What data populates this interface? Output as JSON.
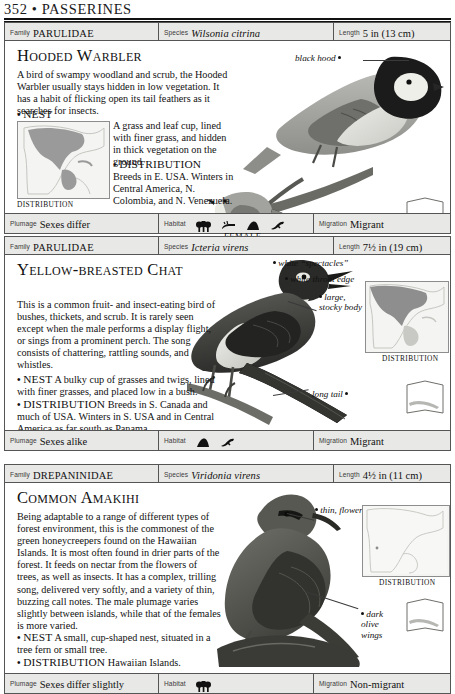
{
  "page": {
    "folio": "352 • PASSERINES"
  },
  "labels": {
    "family": "Family",
    "species": "Species",
    "length": "Length",
    "plumage": "Plumage",
    "habitat": "Habitat",
    "migration": "Migration",
    "distribution_caption": "DISTRIBUTION",
    "female_caption": "FEMALE"
  },
  "entries": [
    {
      "family": "PARULIDAE",
      "species": "Wilsonia citrina",
      "length": "5 in (13 cm)",
      "title": "Hooded Warbler",
      "description": "A bird of swampy woodland and scrub, the Hooded Warbler usually stays hidden in low vegetation. It has a habit of flicking open its tail feathers as it searches for insects.",
      "nest_label": "NEST",
      "nest": "A grass and leaf cup, lined with finer grass, and hidden in thick vegetation on the ground.",
      "dist_label": "DISTRIBUTION",
      "dist": "Breeds in E. USA. Winters in Central America, N. Colombia, and N. Venezuela.",
      "plumage": "Sexes differ",
      "migration": "Migrant",
      "habitat_icons": [
        "trees-icon",
        "reeds-icon",
        "hill-icon",
        "flying-bird-icon"
      ],
      "callouts": [
        {
          "text": "black hood"
        }
      ],
      "figure_caption": "FEMALE"
    },
    {
      "family": "PARULIDAE",
      "species": "Icteria virens",
      "length": "7½ in (19 cm)",
      "title": "Yellow-breasted Chat",
      "description": "This is a common fruit- and insect-eating bird of bushes, thickets, and scrub. It is rarely seen except when the male performs a display flight, or sings from a prominent perch. The song consists of chattering, rattling sounds, and whistles.",
      "nest_label": "NEST",
      "nest": "A bulky cup of grasses and twigs, lined with finer grasses, and placed low in a bush.",
      "dist_label": "DISTRIBUTION",
      "dist": "Breeds in S. Canada and much of USA. Winters in S. USA and in Central America as far south as Panama.",
      "plumage": "Sexes alike",
      "migration": "Migrant",
      "habitat_icons": [
        "hill-icon",
        "flying-bird-icon"
      ],
      "callouts": [
        {
          "text": "white “spectacles”"
        },
        {
          "text": "white throat edge"
        },
        {
          "text": "large, stocky body"
        },
        {
          "text": "long tail"
        }
      ]
    },
    {
      "family": "DREPANINIDAE",
      "species": "Viridonia virens",
      "length": "4½ in (11 cm)",
      "title": "Common Amakihi",
      "description": "Being adaptable to a range of different types of forest environment, this is the commonest of the green honeycreepers found on the Hawaiian Islands. It is most often found in drier parts of the forest. It feeds on nectar from the flowers of trees, as well as insects. It has a complex, trilling song, delivered very softly, and a variety of thin, buzzing call notes. The male plumage varies slightly between islands, while that of the females is more varied.",
      "nest_label": "NEST",
      "nest": "A small, cup-shaped nest, situated in a tree fern or small tree.",
      "dist_label": "DISTRIBUTION",
      "dist": "Hawaiian Islands.",
      "plumage": "Sexes differ slightly",
      "migration": "Non-migrant",
      "habitat_icons": [
        "trees-icon"
      ],
      "callouts": [
        {
          "text": "thin, flower-probing bill"
        },
        {
          "text": "dark olive wings"
        }
      ]
    }
  ],
  "colors": {
    "bar_fill": "#e8e8e6",
    "rule": "#555555",
    "text": "#111111",
    "map_land": "#f4f4f2",
    "map_range": "#9a9a9a"
  }
}
